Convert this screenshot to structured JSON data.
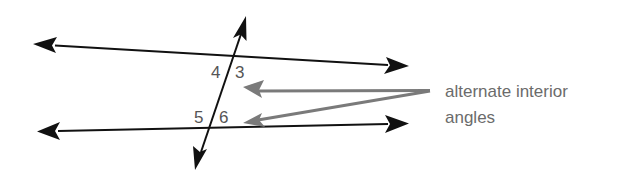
{
  "diagram": {
    "angle_labels": {
      "a4": "4",
      "a3": "3",
      "a5": "5",
      "a6": "6"
    },
    "caption": {
      "line1": "alternate interior",
      "line2": "angles"
    },
    "annotation_targets": [
      "3",
      "6"
    ],
    "colors": {
      "lines": "#111111",
      "pointer_arrows": "#7a7a7a",
      "labels": "#555555",
      "caption": "#6b6b6b",
      "background": "#ffffff"
    }
  }
}
